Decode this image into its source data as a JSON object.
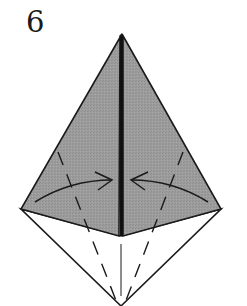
{
  "step": {
    "number": "6"
  },
  "diagram": {
    "colors": {
      "paper_colored_side": "#9a9a9a",
      "paper_white_side": "#ffffff",
      "line": "#1a1a1a"
    },
    "points": {
      "apex": [
        122,
        34
      ],
      "left_corner": [
        21,
        209
      ],
      "right_corner": [
        221,
        209
      ],
      "center_bottom_of_gray": [
        121,
        236
      ],
      "bottom_point": [
        121,
        306
      ]
    },
    "fold_lines": [
      {
        "type": "valley",
        "side": "left",
        "from": [
          58,
          152
        ],
        "to": [
          117,
          303
        ]
      },
      {
        "type": "valley",
        "side": "right",
        "from": [
          183,
          152
        ],
        "to": [
          125,
          303
        ]
      }
    ],
    "arrows": [
      {
        "side": "left",
        "from": [
          35,
          202
        ],
        "to": [
          112,
          180
        ],
        "direction": "toward-center"
      },
      {
        "side": "right",
        "from": [
          208,
          202
        ],
        "to": [
          131,
          180
        ],
        "direction": "toward-center"
      }
    ]
  }
}
